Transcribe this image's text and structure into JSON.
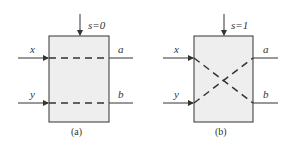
{
  "diagram": {
    "panels": [
      {
        "caption": "(a)",
        "control": "s=0",
        "inputs": [
          "x",
          "y"
        ],
        "outputs": [
          "a",
          "b"
        ],
        "mode": "straight"
      },
      {
        "caption": "(b)",
        "control": "s=1",
        "inputs": [
          "x",
          "y"
        ],
        "outputs": [
          "a",
          "b"
        ],
        "mode": "crossed"
      }
    ],
    "colors": {
      "box_fill": "#eeeeee",
      "stroke": "#333333"
    }
  }
}
